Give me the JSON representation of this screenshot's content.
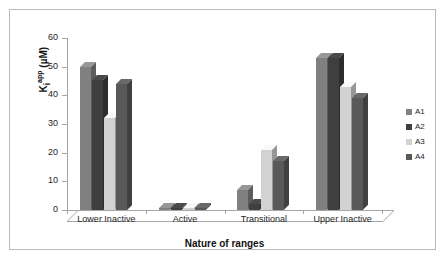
{
  "chart_data": {
    "type": "bar",
    "title": "",
    "xlabel": "Nature of ranges",
    "ylabel": "Ki app (µM)",
    "ylabel_base": "K",
    "ylabel_sub": "i",
    "ylabel_sup": "app",
    "ylabel_units": " (µM)",
    "categories": [
      "Lower Inactive",
      "Active",
      "Transitional",
      "Upper Inactive"
    ],
    "ylim": [
      0,
      60
    ],
    "yticks": [
      0,
      10,
      20,
      30,
      40,
      50,
      60
    ],
    "grid": false,
    "legend_position": "right",
    "series": [
      {
        "name": "A1",
        "color": "#808080",
        "values": [
          50,
          0.6,
          7,
          53
        ]
      },
      {
        "name": "A2",
        "color": "#3f3f3f",
        "values": [
          45.5,
          0.6,
          2,
          53
        ]
      },
      {
        "name": "A3",
        "color": "#d2d2d2",
        "values": [
          32,
          0.6,
          21,
          43
        ]
      },
      {
        "name": "A4",
        "color": "#595959",
        "values": [
          44,
          0.6,
          17,
          39
        ]
      }
    ]
  },
  "legend": {
    "entries": [
      {
        "label": "A1"
      },
      {
        "label": "A2"
      },
      {
        "label": "A3"
      },
      {
        "label": "A4"
      }
    ]
  },
  "axis": {
    "y_tick_labels": [
      "60",
      "50",
      "40",
      "30",
      "20",
      "10",
      "0"
    ]
  }
}
